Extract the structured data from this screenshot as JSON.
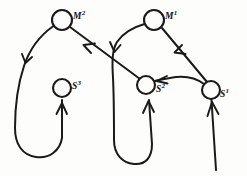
{
  "diagram": {
    "type": "directed-graph",
    "ink_color": "#1a1a1a",
    "background_color": "#fdfdfb",
    "nodes": [
      {
        "id": "M2",
        "label_main": "M",
        "label_sup": "2",
        "cx": 62,
        "cy": 20,
        "r": 10,
        "label_x": 73,
        "label_y": 11
      },
      {
        "id": "M1",
        "label_main": "M",
        "label_sup": "1",
        "cx": 154,
        "cy": 20,
        "r": 10,
        "label_x": 165,
        "label_y": 11
      },
      {
        "id": "S3",
        "label_main": "S",
        "label_sup": "3",
        "cx": 62,
        "cy": 88,
        "r": 9,
        "label_x": 72,
        "label_y": 81
      },
      {
        "id": "S2",
        "label_main": "S",
        "label_sup": "2",
        "cx": 146,
        "cy": 85,
        "r": 9,
        "label_x": 156,
        "label_y": 84
      },
      {
        "id": "S1",
        "label_main": "S",
        "label_sup": "1",
        "cx": 211,
        "cy": 90,
        "r": 9,
        "label_x": 220,
        "label_y": 89
      }
    ],
    "edges": [
      {
        "from": "M2",
        "to": "S3",
        "shape": "long-left-loop",
        "arrow_count": 2
      },
      {
        "from": "S2",
        "to": "M2",
        "shape": "diagonal-up-left",
        "arrow_count": 1
      },
      {
        "from": "M1",
        "to": "S2",
        "shape": "left-loop",
        "arrow_count": 2
      },
      {
        "from": "S1",
        "to": "M1",
        "shape": "diagonal-up-left",
        "arrow_count": 1
      },
      {
        "from": "S1",
        "to": "S2",
        "shape": "horizontal-left",
        "arrow_count": 1
      },
      {
        "from": "input",
        "to": "S1",
        "shape": "vertical-up",
        "arrow_count": 1
      }
    ]
  }
}
